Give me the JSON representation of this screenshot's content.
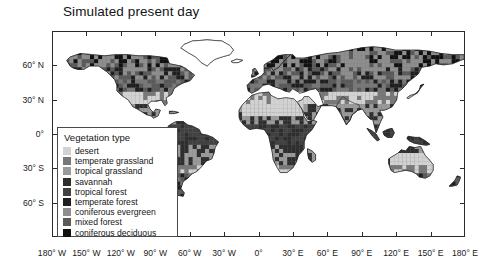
{
  "title": "Simulated present day",
  "chart_data": {
    "type": "map",
    "title": "Simulated present day",
    "projection": "equirectangular",
    "xlabel": "",
    "ylabel": "",
    "xlim": [
      -180,
      180
    ],
    "ylim": [
      -90,
      90
    ],
    "grid": false,
    "legend_position": "inside-lower-left",
    "x_ticks": [
      {
        "value": -180,
        "label": "180° W"
      },
      {
        "value": -150,
        "label": "150° W"
      },
      {
        "value": -120,
        "label": "120° W"
      },
      {
        "value": -90,
        "label": "90° W"
      },
      {
        "value": -60,
        "label": "60° W"
      },
      {
        "value": -30,
        "label": "30° W"
      },
      {
        "value": 0,
        "label": "0°"
      },
      {
        "value": 30,
        "label": "30° E"
      },
      {
        "value": 60,
        "label": "60° E"
      },
      {
        "value": 90,
        "label": "90° E"
      },
      {
        "value": 120,
        "label": "120° E"
      },
      {
        "value": 150,
        "label": "150° E"
      },
      {
        "value": 180,
        "label": "180° E"
      }
    ],
    "y_ticks": [
      {
        "value": 60,
        "label": "60° N"
      },
      {
        "value": 30,
        "label": "30° N"
      },
      {
        "value": 0,
        "label": "0°"
      },
      {
        "value": -30,
        "label": "30° S"
      },
      {
        "value": -60,
        "label": "60° S"
      }
    ]
  },
  "legend": {
    "title": "Vegetation type",
    "items": [
      {
        "label": "desert",
        "color": "#d2d2d2"
      },
      {
        "label": "temperate grassland",
        "color": "#787878"
      },
      {
        "label": "tropical grassland",
        "color": "#9a9a9a"
      },
      {
        "label": "savannah",
        "color": "#2e2e2e"
      },
      {
        "label": "tropical forest",
        "color": "#414141"
      },
      {
        "label": "temperate forest",
        "color": "#1f1f1f"
      },
      {
        "label": "coniferous evergreen",
        "color": "#8e8e8e"
      },
      {
        "label": "mixed forest",
        "color": "#5a5a5a"
      },
      {
        "label": "coniferous deciduous",
        "color": "#111111"
      }
    ]
  }
}
